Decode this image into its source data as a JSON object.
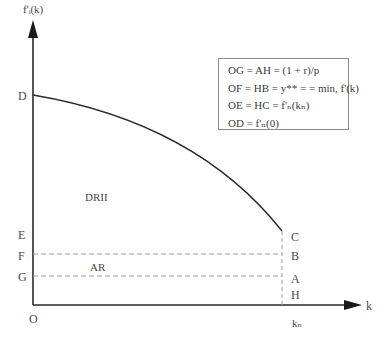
{
  "diagram": {
    "y_axis_label": "f'ᵢ(k)",
    "x_axis_label": "k",
    "origin_label": "O",
    "left_labels": [
      "D",
      "E",
      "F",
      "G"
    ],
    "right_labels": [
      "C",
      "B",
      "A",
      "H"
    ],
    "x_tick_label": "kₙ",
    "region_labels": {
      "upper": "DRII",
      "lower": "AR"
    },
    "legend": [
      "OG = AH = (1 + r)/p",
      "OF = HB = y** = = min, f'(k)",
      "OE = HC = f'ₙ(kₙ)",
      "OD = f'ₙ(0)"
    ],
    "colors": {
      "axis": "#2a2a2a",
      "curve": "#2a2a2a",
      "dashed": "#9a9a9a",
      "box_border": "#8a8a8a",
      "text": "#3a3a3a"
    }
  }
}
